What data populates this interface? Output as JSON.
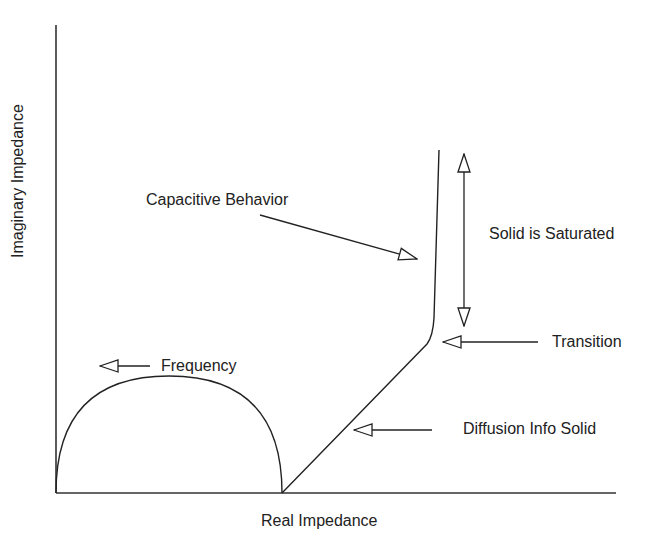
{
  "diagram": {
    "type": "nyquist-impedance-schematic",
    "axes": {
      "xlabel": "Real Impedance",
      "ylabel": "Imaginary Impedance"
    },
    "annotations": {
      "frequency": "Frequency",
      "capacitive": "Capacitive Behavior",
      "saturated": "Solid is Saturated",
      "transition": "Transition",
      "diffusion": "Diffusion Info Solid"
    },
    "colors": {
      "line": "#222222",
      "background": "#ffffff"
    }
  }
}
